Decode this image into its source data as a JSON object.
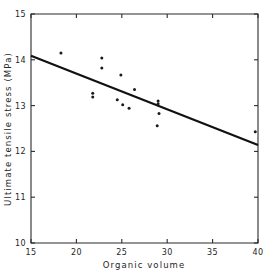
{
  "chart_data": {
    "type": "scatter",
    "title": "",
    "xlabel": "Organic volume",
    "ylabel": "Ultimate tensile stress (MPa)",
    "xlim": [
      15,
      40
    ],
    "ylim": [
      10,
      15
    ],
    "xticks": [
      15,
      20,
      25,
      30,
      35,
      40
    ],
    "yticks": [
      10,
      11,
      12,
      13,
      14,
      15
    ],
    "xtick_labels": [
      "15",
      "20",
      "25",
      "30",
      "35",
      "40"
    ],
    "ytick_labels": [
      "10",
      "11",
      "12",
      "13",
      "14",
      "15"
    ],
    "grid": false,
    "legend": false,
    "series": [
      {
        "name": "observations",
        "marker": "dot",
        "color": "#1a1a1a",
        "points": [
          {
            "x": 18.3,
            "y": 14.15
          },
          {
            "x": 22.8,
            "y": 14.04
          },
          {
            "x": 22.8,
            "y": 13.82
          },
          {
            "x": 24.9,
            "y": 13.67
          },
          {
            "x": 21.8,
            "y": 13.27
          },
          {
            "x": 21.8,
            "y": 13.19
          },
          {
            "x": 26.4,
            "y": 13.35
          },
          {
            "x": 24.5,
            "y": 13.13
          },
          {
            "x": 25.1,
            "y": 13.02
          },
          {
            "x": 25.8,
            "y": 12.94
          },
          {
            "x": 29.0,
            "y": 13.1
          },
          {
            "x": 29.0,
            "y": 13.04
          },
          {
            "x": 29.1,
            "y": 12.83
          },
          {
            "x": 28.9,
            "y": 12.56
          },
          {
            "x": 39.7,
            "y": 12.43
          }
        ]
      }
    ],
    "fit_line": {
      "name": "linear regression",
      "color": "#111111",
      "x_start": 15.0,
      "y_start": 14.09,
      "x_end": 40.0,
      "y_end": 12.14,
      "slope": -0.078,
      "intercept": 15.26
    }
  }
}
